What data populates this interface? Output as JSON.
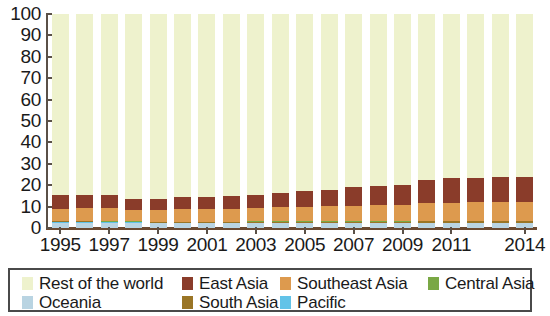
{
  "chart_data": {
    "type": "bar",
    "stacked": true,
    "title": "",
    "subtitle": "",
    "xlabel": "",
    "ylabel": "",
    "ylim": [
      0,
      100
    ],
    "ytick_labels": [
      "100",
      "90",
      "80",
      "70",
      "60",
      "50",
      "40",
      "30",
      "20",
      "10",
      "0"
    ],
    "ytick_values": [
      100,
      90,
      80,
      70,
      60,
      50,
      40,
      30,
      20,
      10,
      0
    ],
    "grid": false,
    "legend_position": "bottom",
    "categories": [
      "1995",
      "1996",
      "1997",
      "1998",
      "1999",
      "2000",
      "2001",
      "2002",
      "2003",
      "2004",
      "2005",
      "2006",
      "2007",
      "2008",
      "2009",
      "2010",
      "2011",
      "2012",
      "2013",
      "2014"
    ],
    "xtick_labels": [
      "1995",
      "1997",
      "1999",
      "2001",
      "2003",
      "2005",
      "2007",
      "2009",
      "2011",
      "2014"
    ],
    "series": [
      {
        "name": "Oceania",
        "color": "#b9d4e2",
        "values": [
          2.4,
          2.4,
          2.3,
          2.3,
          2.2,
          2.2,
          2.2,
          2.2,
          2.2,
          2.2,
          2.2,
          2.2,
          2.2,
          2.2,
          2.2,
          2.2,
          2.2,
          2.2,
          2.2,
          2.2
        ]
      },
      {
        "name": "Pacific",
        "color": "#62c3e8",
        "values": [
          0.3,
          0.3,
          0.3,
          0.3,
          0.3,
          0.3,
          0.3,
          0.3,
          0.3,
          0.3,
          0.3,
          0.3,
          0.3,
          0.3,
          0.3,
          0.3,
          0.3,
          0.3,
          0.3,
          0.3
        ]
      },
      {
        "name": "South Asia",
        "color": "#9a7526",
        "values": [
          0.4,
          0.4,
          0.4,
          0.4,
          0.4,
          0.4,
          0.4,
          0.4,
          0.4,
          0.5,
          0.5,
          0.5,
          0.5,
          0.5,
          0.5,
          0.6,
          0.6,
          0.6,
          0.6,
          0.6
        ]
      },
      {
        "name": "Central Asia",
        "color": "#7aa845",
        "values": [
          0.15,
          0.15,
          0.15,
          0.15,
          0.15,
          0.15,
          0.15,
          0.15,
          0.2,
          0.2,
          0.2,
          0.2,
          0.2,
          0.2,
          0.2,
          0.2,
          0.25,
          0.25,
          0.25,
          0.25
        ]
      },
      {
        "name": "Southeast Asia",
        "color": "#dd9a4e",
        "values": [
          5.8,
          6.0,
          6.2,
          5.4,
          5.2,
          5.8,
          6.0,
          6.0,
          6.2,
          6.4,
          6.8,
          7.0,
          7.3,
          7.5,
          7.6,
          8.2,
          8.5,
          8.6,
          8.6,
          8.7
        ]
      },
      {
        "name": "East Asia",
        "color": "#8a3c2a",
        "values": [
          6.4,
          6.4,
          6.2,
          5.1,
          5.2,
          5.6,
          5.6,
          5.8,
          6.0,
          6.6,
          7.2,
          7.8,
          8.6,
          9.0,
          9.4,
          10.8,
          11.4,
          11.6,
          11.8,
          11.8
        ]
      },
      {
        "name": "Rest of the world",
        "color": "#eef2cd",
        "values": [
          84.55,
          84.35,
          84.45,
          86.35,
          86.55,
          85.55,
          85.35,
          85.15,
          84.7,
          83.8,
          82.8,
          82.0,
          80.9,
          80.3,
          79.8,
          77.7,
          76.75,
          76.45,
          76.25,
          76.15
        ]
      }
    ]
  },
  "legend": {
    "items": [
      {
        "label": "Rest of the world",
        "color": "#eef2cd"
      },
      {
        "label": "East Asia",
        "color": "#8a3c2a"
      },
      {
        "label": "Southeast Asia",
        "color": "#dd9a4e"
      },
      {
        "label": "Central Asia",
        "color": "#7aa845"
      },
      {
        "label": "Oceania",
        "color": "#b9d4e2"
      },
      {
        "label": "South Asia",
        "color": "#9a7526"
      },
      {
        "label": "Pacific",
        "color": "#62c3e8"
      }
    ]
  }
}
